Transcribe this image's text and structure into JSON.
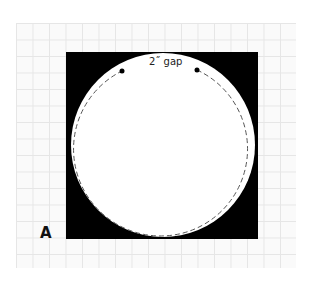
{
  "figure": {
    "panel_label": "A",
    "gap_label": "2˝ gap",
    "colors": {
      "background_square": "#000000",
      "circle_fill": "#ffffff",
      "stitch_line": "#555555",
      "grid_line": "#e6e6e6",
      "grid_bg": "#fafafa"
    },
    "elements": {
      "square": {
        "x": 66,
        "y": 52,
        "width": 192,
        "height": 187
      },
      "circle": {
        "cx": 163,
        "cy": 145,
        "r": 92
      },
      "stitch_circle": {
        "cx": 163,
        "cy": 145,
        "r": 87,
        "dash": "5 3"
      },
      "gap_markers": [
        {
          "cx": 122,
          "cy": 71
        },
        {
          "cx": 197,
          "cy": 70
        }
      ]
    }
  }
}
